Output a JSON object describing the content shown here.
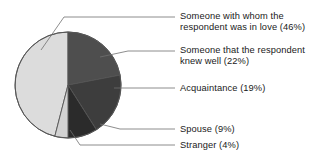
{
  "chart_data": {
    "type": "pie",
    "title": "",
    "subtitle": "",
    "xlabel": "",
    "ylabel": "",
    "legend_position": "right-callout-labels",
    "grid": false,
    "units": "percent",
    "categories": [
      "Someone with whom the respondent was in love",
      "Someone that the respondent knew well",
      "Acquaintance",
      "Spouse",
      "Stranger"
    ],
    "values": [
      46,
      22,
      19,
      9,
      4
    ],
    "value_labels": [
      "46%",
      "22%",
      "19%",
      "9%",
      "4%"
    ],
    "colors": [
      "#dcdcdc",
      "#4e4e4e",
      "#3d3d3d",
      "#2b2b2b",
      "#d2d2d2"
    ],
    "slices": [
      {
        "name": "love",
        "label_lines": [
          "Someone with whom the",
          "respondent was in love (46%)"
        ],
        "value": 46,
        "value_label": "46%",
        "color": "#dcdcdc"
      },
      {
        "name": "knew-well",
        "label_lines": [
          "Someone that the respondent",
          "knew well (22%)"
        ],
        "value": 22,
        "value_label": "22%",
        "color": "#4e4e4e"
      },
      {
        "name": "acquaintance",
        "label_lines": [
          "Acquaintance (19%)"
        ],
        "value": 19,
        "value_label": "19%",
        "color": "#3d3d3d"
      },
      {
        "name": "spouse",
        "label_lines": [
          "Spouse (9%)"
        ],
        "value": 9,
        "value_label": "9%",
        "color": "#2b2b2b"
      },
      {
        "name": "stranger",
        "label_lines": [
          "Stranger (4%)"
        ],
        "value": 4,
        "value_label": "4%",
        "color": "#d2d2d2"
      }
    ]
  },
  "labels": {
    "love_line1": "Someone with whom the",
    "love_line2": "respondent was in love (46%)",
    "knew_well_line1": "Someone that the respondent",
    "knew_well_line2": "knew well (22%)",
    "acquaintance_line1": "Acquaintance (19%)",
    "spouse_line1": "Spouse (9%)",
    "stranger_line1": "Stranger (4%)"
  },
  "style": {
    "outline_color": "#555555",
    "leader_color": "#707070",
    "text_color": "#1a1a1a",
    "background": "#ffffff"
  }
}
